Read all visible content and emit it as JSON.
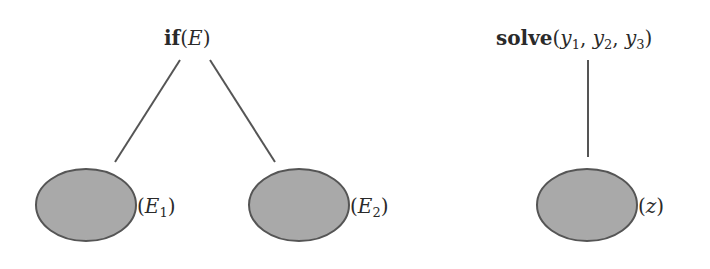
{
  "diagram": {
    "colors": {
      "background": "#ffffff",
      "edge": "#555555",
      "node_fill": "#a9a9a9",
      "node_stroke": "#555555",
      "text": "#2a2a2a"
    },
    "trees": [
      {
        "root": {
          "keyword": "if",
          "open": "(",
          "arg": "E",
          "close": ")"
        },
        "children": [
          {
            "open": "(",
            "var": "E",
            "sub": "1",
            "close": ")"
          },
          {
            "open": "(",
            "var": "E",
            "sub": "2",
            "close": ")"
          }
        ]
      },
      {
        "root": {
          "keyword": "solve",
          "open": "(",
          "args": [
            {
              "var": "y",
              "sub": "1"
            },
            {
              "var": "y",
              "sub": "2"
            },
            {
              "var": "y",
              "sub": "3"
            }
          ],
          "sep": ", ",
          "close": ")"
        },
        "children": [
          {
            "open": "(",
            "var": "z",
            "close": ")"
          }
        ]
      }
    ]
  }
}
